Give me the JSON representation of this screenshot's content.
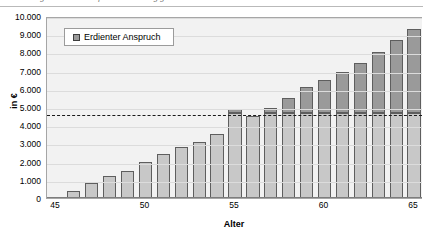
{
  "caption": {
    "text": "Abbildung: Erdienter Anspruch in Abhängigkeit vom Lebensalter"
  },
  "legend": {
    "position": "top-left-inside",
    "swatch_icon": "legend-square-icon",
    "entries": [
      {
        "label": "Erdienter Anspruch",
        "color": "#9a9a9a"
      }
    ]
  },
  "colors": {
    "bar_lower": "#c8c8c8",
    "bar_upper": "#9a9a9a",
    "bar_border": "#5e5e5e",
    "plot_background": "#f2f2f2",
    "gridline": "#dcdcdc",
    "reference_line": "#1a1a1a"
  },
  "chart_data": {
    "type": "bar",
    "title": "",
    "subtitle": "",
    "xlabel": "Alter",
    "ylabel": "in €",
    "xlim": [
      45,
      65
    ],
    "ylim": [
      0,
      10000
    ],
    "ytick_labels": [
      "0",
      "1.000",
      "2.000",
      "3.000",
      "4.000",
      "5.000",
      "6.000",
      "7.000",
      "8.000",
      "9.000",
      "10.000"
    ],
    "ytick_values": [
      0,
      1000,
      2000,
      3000,
      4000,
      5000,
      6000,
      7000,
      8000,
      9000,
      10000
    ],
    "xtick_labels": [
      "45",
      "50",
      "55",
      "60",
      "65"
    ],
    "xtick_values": [
      45,
      50,
      55,
      60,
      65
    ],
    "grid": true,
    "legend_position": "upper left",
    "categories": [
      46,
      47,
      48,
      49,
      50,
      51,
      52,
      53,
      54,
      55,
      56,
      57,
      58,
      59,
      60,
      61,
      62,
      63,
      64,
      65
    ],
    "values": [
      400,
      800,
      1200,
      1500,
      2000,
      2400,
      2800,
      3100,
      3500,
      4900,
      4500,
      4950,
      5500,
      6100,
      6500,
      6900,
      7400,
      8000,
      8700,
      9300
    ],
    "series": [
      {
        "name": "Erdienter Anspruch",
        "values": [
          400,
          800,
          1200,
          1500,
          2000,
          2400,
          2800,
          3100,
          3500,
          4900,
          4500,
          4950,
          5500,
          6100,
          6500,
          6900,
          7400,
          8000,
          8700,
          9300
        ]
      }
    ],
    "annotations": [
      {
        "name": "reference-line",
        "type": "hline",
        "value": 4650,
        "style": "dashed",
        "label": ""
      }
    ]
  }
}
